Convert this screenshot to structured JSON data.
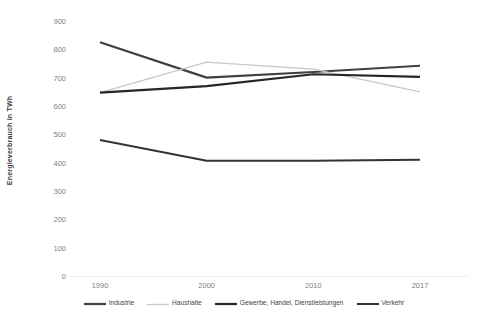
{
  "chart_data": {
    "type": "line",
    "title": "",
    "xlabel": "",
    "ylabel": "Energieverbrauch in TWh",
    "categories": [
      "1990",
      "2000",
      "2010",
      "2017"
    ],
    "x": [
      1990,
      2000,
      2010,
      2017
    ],
    "ylim": [
      0,
      900
    ],
    "yticks": [
      0,
      100,
      200,
      300,
      400,
      500,
      600,
      700,
      800,
      900
    ],
    "ytick_labels": [
      "0",
      "100",
      "200",
      "300",
      "400",
      "500",
      "600",
      "700",
      "800",
      "900"
    ],
    "grid": false,
    "legend_position": "bottom",
    "series": [
      {
        "name": "Industrie",
        "values": [
          825,
          700,
          720,
          742
        ],
        "color": "#404040",
        "width": 2.2
      },
      {
        "name": "Haushalte",
        "values": [
          647,
          755,
          730,
          650
        ],
        "color": "#c8c8c8",
        "width": 1.3
      },
      {
        "name": "Gewerbe, Handel, Dienstleistungen",
        "values": [
          647,
          670,
          712,
          703
        ],
        "color": "#262626",
        "width": 2.2
      },
      {
        "name": "Verkehr",
        "values": [
          480,
          407,
          407,
          410
        ],
        "color": "#333333",
        "width": 2.0
      }
    ]
  },
  "axis": {
    "y_title": "Energieverbrauch in TWh"
  },
  "colors": {
    "background": "#ffffff",
    "tick_text": "#808080",
    "axis_title": "#404040",
    "baseline": "#f0f0f0"
  }
}
